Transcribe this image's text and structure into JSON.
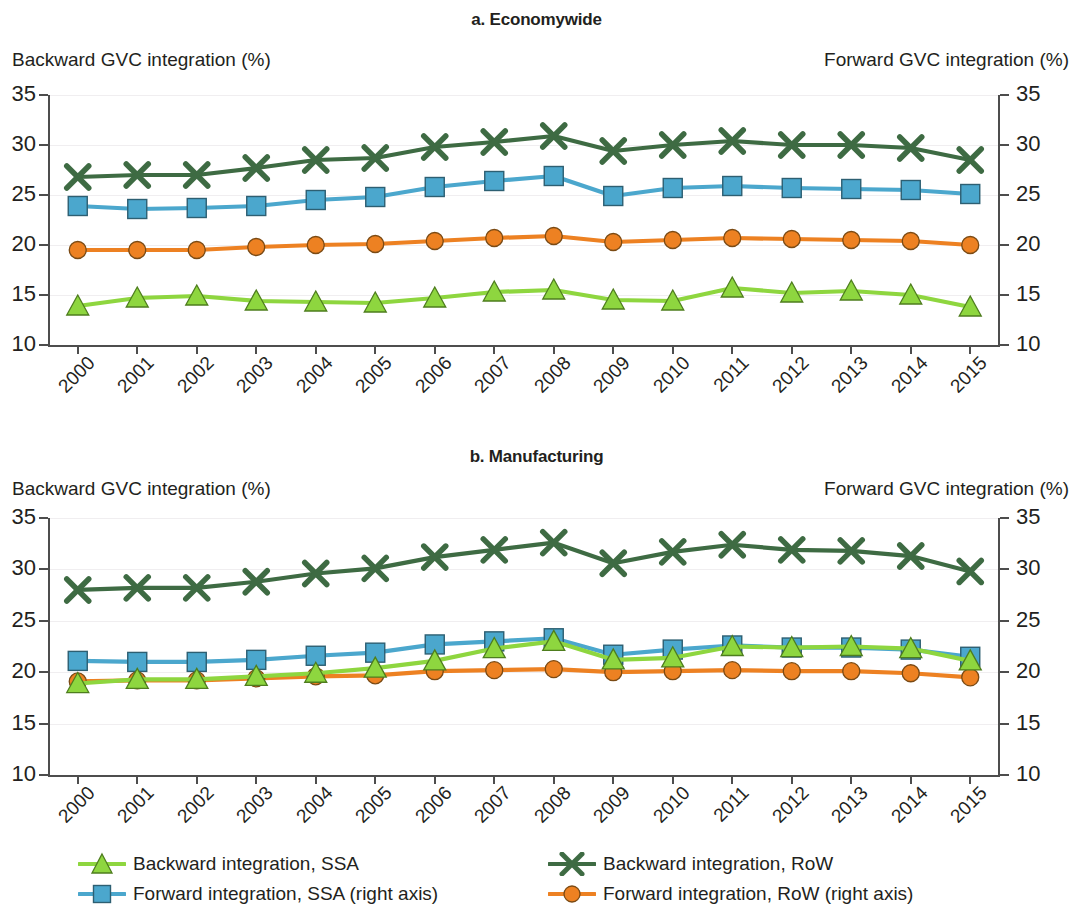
{
  "panels": [
    {
      "id": "economywide",
      "title": "a. Economywide",
      "left_caption": "Backward GVC integration (%)",
      "right_caption": "Forward GVC integration (%)"
    },
    {
      "id": "manufacturing",
      "title": "b. Manufacturing",
      "left_caption": "Backward GVC integration (%)",
      "right_caption": "Forward GVC integration (%)"
    }
  ],
  "legend": {
    "items": [
      {
        "label": "Backward integration, SSA",
        "marker": "triangle-up-marker",
        "color": "#8ed63f",
        "line": "#8ed63f"
      },
      {
        "label": "Backward integration, RoW",
        "marker": "cross-x-marker",
        "color": "#3e6b43",
        "line": "#3e6b43"
      },
      {
        "label": "Forward integration, SSA (right axis)",
        "marker": "square-marker",
        "color": "#4ba7cd",
        "line": "#4ba7cd"
      },
      {
        "label": "Forward integration, RoW (right axis)",
        "marker": "circle-marker",
        "color": "#ed8122",
        "line": "#ed8122"
      }
    ]
  },
  "colors": {
    "backward_ssa": "#8ed63f",
    "backward_row": "#3e6b43",
    "forward_ssa": "#4ba7cd",
    "forward_row": "#ed8122",
    "axis": "#4d4d4d",
    "grid": "#f0eef0",
    "text": "#231f20"
  },
  "chart_data": [
    {
      "type": "line",
      "title": "a. Economywide",
      "xlabel": "",
      "ylabel": "Backward GVC integration (%)",
      "y2label": "Forward GVC integration (%)",
      "x": [
        "2000",
        "2001",
        "2002",
        "2003",
        "2004",
        "2005",
        "2006",
        "2007",
        "2008",
        "2009",
        "2010",
        "2011",
        "2012",
        "2013",
        "2014",
        "2015"
      ],
      "ylim": [
        10,
        35
      ],
      "y2lim": [
        10,
        35
      ],
      "yticks": [
        10,
        15,
        20,
        25,
        30,
        35
      ],
      "y2ticks": [
        10,
        15,
        20,
        25,
        30,
        35
      ],
      "grid": true,
      "legend_position": "bottom",
      "series": [
        {
          "name": "Backward integration, SSA",
          "axis": "left",
          "marker": "triangle",
          "color": "#8ed63f",
          "values": [
            13.9,
            14.7,
            14.9,
            14.4,
            14.3,
            14.2,
            14.7,
            15.3,
            15.5,
            14.5,
            14.4,
            15.7,
            15.2,
            15.4,
            15.0,
            13.8
          ]
        },
        {
          "name": "Backward integration, RoW",
          "axis": "left",
          "marker": "x",
          "color": "#3e6b43",
          "values": [
            26.8,
            27.0,
            27.0,
            27.7,
            28.5,
            28.7,
            29.8,
            30.3,
            30.9,
            29.4,
            30.0,
            30.4,
            30.0,
            30.0,
            29.7,
            28.5
          ]
        },
        {
          "name": "Forward integration, SSA (right axis)",
          "axis": "right",
          "marker": "square",
          "color": "#4ba7cd",
          "values": [
            23.9,
            23.6,
            23.7,
            23.9,
            24.5,
            24.8,
            25.8,
            26.4,
            26.9,
            24.9,
            25.7,
            25.9,
            25.7,
            25.6,
            25.5,
            25.1
          ]
        },
        {
          "name": "Forward integration, RoW (right axis)",
          "axis": "right",
          "marker": "circle",
          "color": "#ed8122",
          "values": [
            19.5,
            19.5,
            19.5,
            19.8,
            20.0,
            20.1,
            20.4,
            20.7,
            20.9,
            20.3,
            20.5,
            20.7,
            20.6,
            20.5,
            20.4,
            20.0
          ]
        }
      ]
    },
    {
      "type": "line",
      "title": "b. Manufacturing",
      "xlabel": "",
      "ylabel": "Backward GVC integration (%)",
      "y2label": "Forward GVC integration (%)",
      "x": [
        "2000",
        "2001",
        "2002",
        "2003",
        "2004",
        "2005",
        "2006",
        "2007",
        "2008",
        "2009",
        "2010",
        "2011",
        "2012",
        "2013",
        "2014",
        "2015"
      ],
      "ylim": [
        10,
        35
      ],
      "y2lim": [
        10,
        35
      ],
      "yticks": [
        10,
        15,
        20,
        25,
        30,
        35
      ],
      "y2ticks": [
        10,
        15,
        20,
        25,
        30,
        35
      ],
      "grid": true,
      "legend_position": "bottom",
      "series": [
        {
          "name": "Backward integration, SSA",
          "axis": "left",
          "marker": "triangle",
          "color": "#8ed63f",
          "values": [
            18.9,
            19.3,
            19.3,
            19.6,
            19.9,
            20.4,
            21.1,
            22.3,
            23.0,
            21.2,
            21.4,
            22.5,
            22.4,
            22.5,
            22.3,
            21.1
          ]
        },
        {
          "name": "Backward integration, RoW",
          "axis": "left",
          "marker": "x",
          "color": "#3e6b43",
          "values": [
            28.0,
            28.2,
            28.2,
            28.8,
            29.6,
            30.1,
            31.2,
            31.9,
            32.6,
            30.6,
            31.7,
            32.4,
            31.9,
            31.8,
            31.3,
            29.8
          ]
        },
        {
          "name": "Forward integration, SSA (right axis)",
          "axis": "right",
          "marker": "square",
          "color": "#4ba7cd",
          "values": [
            21.1,
            21.0,
            21.0,
            21.2,
            21.6,
            21.9,
            22.7,
            23.0,
            23.3,
            21.7,
            22.2,
            22.6,
            22.4,
            22.4,
            22.2,
            21.5
          ]
        },
        {
          "name": "Forward integration, RoW (right axis)",
          "axis": "right",
          "marker": "circle",
          "color": "#ed8122",
          "values": [
            19.1,
            19.2,
            19.2,
            19.4,
            19.6,
            19.7,
            20.1,
            20.2,
            20.3,
            20.0,
            20.1,
            20.2,
            20.1,
            20.1,
            19.9,
            19.5
          ]
        }
      ]
    }
  ]
}
